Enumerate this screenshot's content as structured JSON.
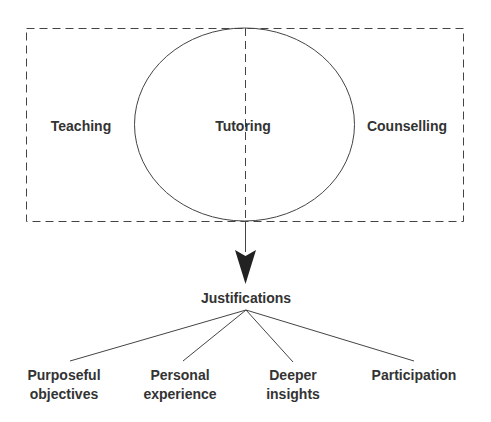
{
  "diagram": {
    "regions": [
      {
        "id": "teaching",
        "label": "Teaching"
      },
      {
        "id": "tutoring",
        "label": "Tutoring"
      },
      {
        "id": "counselling",
        "label": "Counselling"
      }
    ],
    "target": {
      "label": "Justifications"
    },
    "children": [
      {
        "line1": "Purposeful",
        "line2": "objectives"
      },
      {
        "line1": "Personal",
        "line2": "experience"
      },
      {
        "line1": "Deeper",
        "line2": "insights"
      },
      {
        "line1": "Participation",
        "line2": ""
      }
    ],
    "colors": {
      "stroke": "#444444",
      "text": "#333333"
    }
  }
}
